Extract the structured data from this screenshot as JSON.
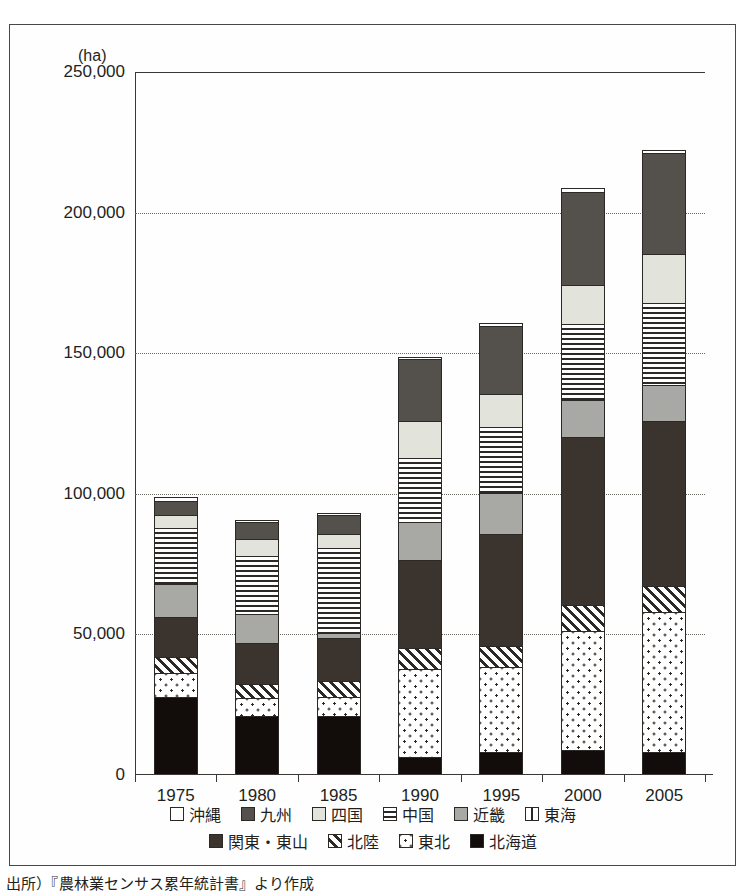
{
  "figure": {
    "unit_label": "(ha)",
    "caption": "出所）『農林業センサス累年統計書』より作成"
  },
  "legend": {
    "rows": [
      [
        {
          "key": "okinawa",
          "label": "沖縄",
          "swatch": "white-square"
        },
        {
          "key": "kyushu",
          "label": "九州",
          "swatch": "dark-gray-square"
        },
        {
          "key": "shikoku",
          "label": "四国",
          "swatch": "light-gray-square"
        },
        {
          "key": "chugoku",
          "label": "中国",
          "swatch": "horizontal-lines-square"
        },
        {
          "key": "kinki",
          "label": "近畿",
          "swatch": "mid-gray-square"
        },
        {
          "key": "tokai",
          "label": "東海",
          "swatch": "vertical-lines-square"
        }
      ],
      [
        {
          "key": "kanto",
          "label": "関東・東山",
          "swatch": "very-dark-square"
        },
        {
          "key": "hokuriku",
          "label": "北陸",
          "swatch": "diagonal-hatch-square"
        },
        {
          "key": "tohoku",
          "label": "東北",
          "swatch": "dotted-square"
        },
        {
          "key": "hokkaido",
          "label": "北海道",
          "swatch": "black-square"
        }
      ]
    ]
  },
  "colors": {
    "okinawa": "#ffffff",
    "kyushu": "#54504c",
    "shikoku": "#e2e4dc",
    "chugoku": "#ffffff",
    "kinki": "#a8a8a4",
    "tokai": "#ffffff",
    "kanto": "#3b332e",
    "hokuriku": "#ffffff",
    "tohoku": "#ffffff",
    "hokkaido": "#120d0a",
    "axis": "#3a3734",
    "grid": "#6d6a66"
  },
  "chart_data": {
    "type": "bar",
    "stacked": true,
    "title": "",
    "xlabel": "",
    "ylabel": "(ha)",
    "ylim": [
      0,
      250000
    ],
    "yticks": [
      0,
      50000,
      100000,
      150000,
      200000,
      250000
    ],
    "ytick_labels": [
      "0",
      "50,000",
      "100,000",
      "150,000",
      "200,000",
      "250,000"
    ],
    "grid": "horizontal-dotted",
    "legend_position": "bottom",
    "categories": [
      "1975",
      "1980",
      "1985",
      "1990",
      "1995",
      "2000",
      "2005"
    ],
    "stack_order_bottom_to_top": [
      "hokkaido",
      "tohoku",
      "hokuriku",
      "kanto",
      "kinki",
      "tokai",
      "chugoku",
      "shikoku",
      "kyushu",
      "okinawa"
    ],
    "series": [
      {
        "name": "北海道",
        "key": "hokkaido",
        "values": [
          27500,
          20500,
          20500,
          6000,
          8000,
          8500,
          8000
        ]
      },
      {
        "name": "東北",
        "key": "tohoku",
        "values": [
          8500,
          6500,
          7000,
          31500,
          30000,
          42500,
          49500
        ]
      },
      {
        "name": "北陸",
        "key": "hokuriku",
        "values": [
          5500,
          5000,
          5500,
          7500,
          7500,
          9000,
          9500
        ]
      },
      {
        "name": "関東・東山",
        "key": "kanto",
        "values": [
          14500,
          14500,
          15500,
          31000,
          40000,
          60000,
          58500
        ]
      },
      {
        "name": "近畿",
        "key": "kinki",
        "values": [
          11500,
          10500,
          1500,
          13500,
          14500,
          13000,
          13000
        ]
      },
      {
        "name": "東海",
        "key": "tokai",
        "values": [
          0,
          0,
          0,
          0,
          0,
          0,
          0
        ]
      },
      {
        "name": "中国",
        "key": "chugoku",
        "values": [
          20000,
          20500,
          30500,
          23000,
          23500,
          27000,
          29000
        ]
      },
      {
        "name": "四国",
        "key": "shikoku",
        "values": [
          4500,
          6000,
          5000,
          13000,
          11500,
          14000,
          17500
        ]
      },
      {
        "name": "九州",
        "key": "kyushu",
        "values": [
          5000,
          6000,
          6500,
          22000,
          24500,
          33000,
          36000
        ]
      },
      {
        "name": "沖縄",
        "key": "okinawa",
        "values": [
          1500,
          1000,
          1000,
          1000,
          1000,
          1500,
          1000
        ]
      }
    ],
    "totals": [
      98500,
      90500,
      93000,
      148500,
      160500,
      208500,
      222000
    ]
  }
}
